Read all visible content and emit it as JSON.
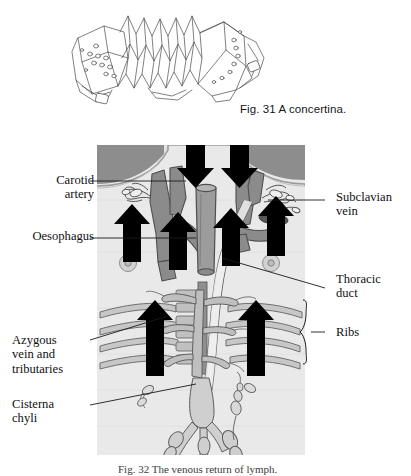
{
  "page": {
    "background_color": "#ffffff",
    "text_color": "#111111"
  },
  "figures": [
    {
      "id": "fig-31",
      "number": "Fig. 31",
      "caption": "Fig. 31 A concertina.",
      "subject": "A concertina.",
      "artwork": "line-drawing-concertina",
      "style": "black line art on white"
    },
    {
      "id": "fig-32",
      "number": "Fig. 32",
      "caption": "Fig. 32 The venous return of lymph.",
      "subject": "The venous return of lymph.",
      "artwork": "greyscale-thorax-lymphatic-diagram",
      "panel": {
        "background_color": "#e8e8e8",
        "shoulder_color": "#8f8f8f",
        "vessel_color": "#7d7d7d",
        "arrow_color": "#000000"
      }
    }
  ],
  "fig31": {
    "caption": "Fig. 31 A concertina."
  },
  "fig32": {
    "caption": "Fig. 32 The venous return of lymph.",
    "labels": {
      "carotid_artery": "Carotid\nartery",
      "oesophagus": "Oesophagus",
      "azygous_vein": "Azygous\nvein and\ntributaries",
      "cisterna_chyli": "Cisterna\nchyli",
      "subclavian_vein": "Subclavian\nvein",
      "thoracic_duct": "Thoracic\nduct",
      "ribs": "Ribs"
    },
    "arrows": {
      "down_count": 2,
      "up_count": 6,
      "meaning": "direction of lymph and venous flow"
    }
  }
}
